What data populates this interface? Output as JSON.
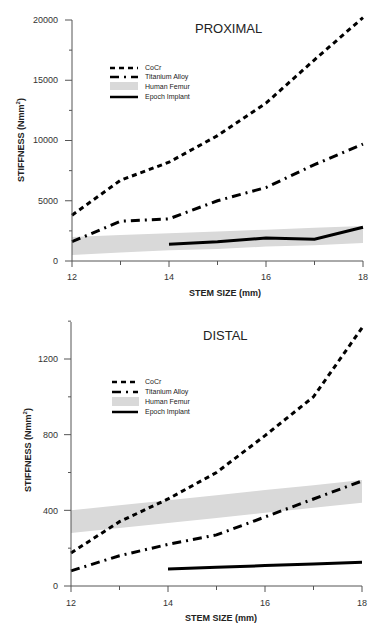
{
  "chart_data": [
    {
      "type": "line",
      "title": "PROXIMAL",
      "xlabel": "STEM SIZE (mm)",
      "ylabel": "STIFFNESS (Nmm 2)",
      "x": [
        12,
        13,
        14,
        15,
        16,
        17,
        18
      ],
      "xticks": [
        "12",
        "14",
        "16",
        "18"
      ],
      "yticks": [
        "0",
        "5000",
        "10000",
        "15000",
        "20000"
      ],
      "xlim": [
        12,
        18
      ],
      "ylim": [
        0,
        20000
      ],
      "grid": false,
      "legend_position": "upper-left",
      "series": [
        {
          "name": "CoCr",
          "style": "dashed",
          "values": [
            3800,
            6700,
            8200,
            10400,
            13100,
            16700,
            20200
          ]
        },
        {
          "name": "Titanium Alloy",
          "style": "dash-dot",
          "values": [
            1600,
            3300,
            3500,
            5000,
            6100,
            8000,
            9700
          ]
        },
        {
          "name": "Human Femur",
          "style": "band",
          "lower": [
            500,
            700,
            900,
            1000,
            1200,
            1300,
            1500
          ],
          "upper": [
            2000,
            2150,
            2300,
            2450,
            2600,
            2750,
            2900
          ]
        },
        {
          "name": "Epoch Implant",
          "style": "solid",
          "x": [
            14,
            15,
            16,
            17,
            18
          ],
          "values": [
            1400,
            1600,
            1900,
            1800,
            2800
          ]
        }
      ]
    },
    {
      "type": "line",
      "title": "DISTAL",
      "xlabel": "STEM SIZE (mm)",
      "ylabel": "STIFFNESS (Nmm 2)",
      "x": [
        12,
        13,
        14,
        15,
        16,
        17,
        18
      ],
      "xticks": [
        "12",
        "14",
        "16",
        "18"
      ],
      "yticks": [
        "0",
        "400",
        "800",
        "1200"
      ],
      "xlim": [
        12,
        18
      ],
      "ylim": [
        0,
        1400
      ],
      "grid": false,
      "legend_position": "upper-left",
      "series": [
        {
          "name": "CoCr",
          "style": "dashed",
          "values": [
            175,
            340,
            460,
            600,
            795,
            1000,
            1365
          ]
        },
        {
          "name": "Titanium Alloy",
          "style": "dash-dot",
          "values": [
            80,
            160,
            220,
            270,
            365,
            460,
            555
          ]
        },
        {
          "name": "Human Femur",
          "style": "band",
          "lower": [
            280,
            307,
            333,
            360,
            387,
            413,
            440
          ],
          "upper": [
            400,
            427,
            453,
            480,
            507,
            533,
            560
          ]
        },
        {
          "name": "Epoch Implant",
          "style": "solid",
          "x": [
            14,
            15,
            16,
            17,
            18
          ],
          "values": [
            90,
            99,
            108,
            116,
            125
          ]
        }
      ]
    }
  ],
  "proximal": {
    "title": "PROXIMAL",
    "xlabel": "STEM SIZE (mm)",
    "ylabel": "STIFFNESS (Nmm",
    "ylabel_sup": "2",
    "ylabel_close": ")",
    "yticks": [
      "0",
      "5000",
      "10000",
      "15000",
      "20000"
    ],
    "xticks": [
      "12",
      "14",
      "16",
      "18"
    ],
    "legend": [
      "CoCr",
      "Titanium Alloy",
      "Human Femur",
      "Epoch Implant"
    ]
  },
  "distal": {
    "title": "DISTAL",
    "xlabel": "STEM SIZE (mm)",
    "ylabel": "STIFFNESS (Nmm",
    "ylabel_sup": "2",
    "ylabel_close": ")",
    "yticks": [
      "0",
      "400",
      "800",
      "1200"
    ],
    "xticks": [
      "12",
      "14",
      "16",
      "18"
    ],
    "legend": [
      "CoCr",
      "Titanium Alloy",
      "Human Femur",
      "Epoch Implant"
    ]
  },
  "colors": {
    "line": "#000000",
    "band": "#d9d9d9",
    "axis": "#555555"
  }
}
